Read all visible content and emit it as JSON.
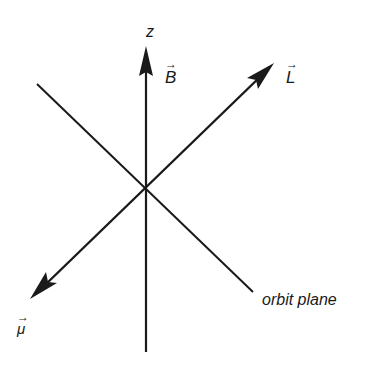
{
  "diagram": {
    "colors": {
      "line": "#1a1a1a",
      "background": "#ffffff"
    },
    "axes": {
      "z": {
        "label": "z",
        "from": [
          146,
          352
        ],
        "to": [
          146,
          48
        ]
      },
      "angular_momentum": {
        "label": "L",
        "from": [
          146,
          192
        ],
        "to": [
          274,
          63
        ]
      },
      "magnetic_moment": {
        "label": "μ",
        "from": [
          146,
          192
        ],
        "to": [
          30,
          299
        ]
      },
      "orbit_plane": {
        "label": "orbit plane",
        "from": [
          37,
          84
        ],
        "to": [
          253,
          292
        ]
      }
    },
    "labels": {
      "z": "z",
      "B": "B",
      "L": "L",
      "mu": "μ",
      "vector_arrow": "→",
      "orbit_plane": "orbit plane"
    }
  }
}
